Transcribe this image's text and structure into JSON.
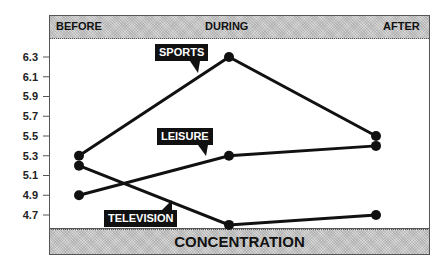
{
  "chart_data": {
    "type": "line",
    "title": "",
    "xlabel": "CONCENTRATION",
    "ylabel": "",
    "categories": [
      "BEFORE",
      "DURING",
      "AFTER"
    ],
    "ylim": [
      4.6,
      6.4
    ],
    "yticks": [
      "6.3",
      "6.1",
      "5.9",
      "5.7",
      "5.5",
      "5.3",
      "5.1",
      "4.9",
      "4.7"
    ],
    "grid": false,
    "legend_position": "inline callouts",
    "series": [
      {
        "name": "SPORTS",
        "values": [
          5.3,
          6.3,
          5.5
        ]
      },
      {
        "name": "LEISURE",
        "values": [
          4.9,
          5.3,
          5.4
        ]
      },
      {
        "name": "TELEVISION",
        "values": [
          5.2,
          4.6,
          4.7
        ]
      }
    ]
  },
  "header": {
    "phases": [
      "BEFORE",
      "DURING",
      "AFTER"
    ]
  },
  "footer": {
    "title": "CONCENTRATION"
  },
  "colors": {
    "line": "#111111",
    "band": "#d6d6d6",
    "frame": "#555555",
    "label_bg": "#111111",
    "label_text": "#ffffff"
  }
}
